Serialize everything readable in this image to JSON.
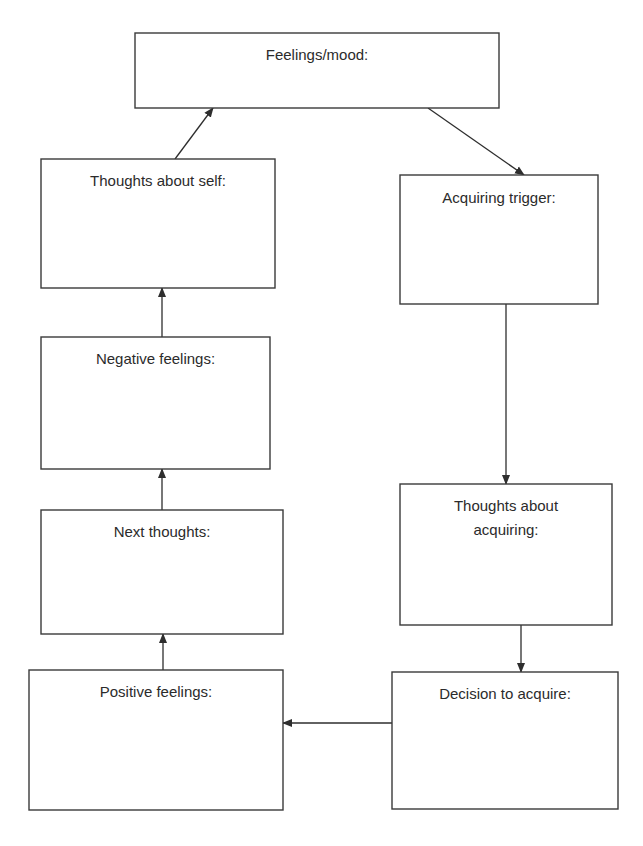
{
  "diagram": {
    "type": "flowchart-cycle",
    "nodes": [
      {
        "id": "feelings_mood",
        "label_lines": [
          "Feelings/mood:"
        ]
      },
      {
        "id": "acquiring_trigger",
        "label_lines": [
          "Acquiring trigger:"
        ]
      },
      {
        "id": "thoughts_about_acquiring",
        "label_lines": [
          "Thoughts about",
          "acquiring:"
        ]
      },
      {
        "id": "decision_to_acquire",
        "label_lines": [
          "Decision to acquire:"
        ]
      },
      {
        "id": "positive_feelings",
        "label_lines": [
          "Positive feelings:"
        ]
      },
      {
        "id": "next_thoughts",
        "label_lines": [
          "Next thoughts:"
        ]
      },
      {
        "id": "negative_feelings",
        "label_lines": [
          "Negative feelings:"
        ]
      },
      {
        "id": "thoughts_about_self",
        "label_lines": [
          "Thoughts about self:"
        ]
      }
    ],
    "edges": [
      {
        "from": "feelings_mood",
        "to": "acquiring_trigger"
      },
      {
        "from": "acquiring_trigger",
        "to": "thoughts_about_acquiring"
      },
      {
        "from": "thoughts_about_acquiring",
        "to": "decision_to_acquire"
      },
      {
        "from": "decision_to_acquire",
        "to": "positive_feelings"
      },
      {
        "from": "positive_feelings",
        "to": "next_thoughts"
      },
      {
        "from": "next_thoughts",
        "to": "negative_feelings"
      },
      {
        "from": "negative_feelings",
        "to": "thoughts_about_self"
      },
      {
        "from": "thoughts_about_self",
        "to": "feelings_mood"
      }
    ],
    "colors": {
      "stroke": "#3a3a3a",
      "text": "#2b2b2b",
      "background": "#ffffff"
    }
  }
}
